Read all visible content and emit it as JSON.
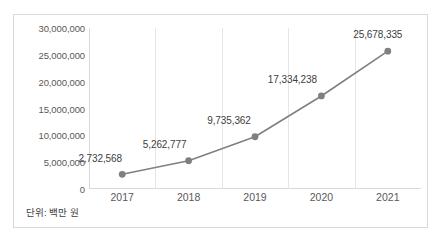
{
  "chart_data": {
    "type": "line",
    "title": "",
    "xlabel": "",
    "ylabel": "",
    "categories": [
      "2017",
      "2018",
      "2019",
      "2020",
      "2021"
    ],
    "values": [
      2732568,
      5262777,
      9735362,
      17334238,
      25678335
    ],
    "data_labels": [
      "2,732,568",
      "5,262,777",
      "9,735,362",
      "17,334,238",
      "25,678,335"
    ],
    "ylim": [
      0,
      30000000
    ],
    "ytick_values": [
      0,
      5000000,
      10000000,
      15000000,
      20000000,
      25000000,
      30000000
    ],
    "ytick_labels": [
      "0",
      "5,000,000",
      "10,000,000",
      "15,000,000",
      "20,000,000",
      "25,000,000",
      "30,000,000"
    ],
    "grid": "vertical-only",
    "legend": "none",
    "series_color": "#808080",
    "marker": "circle"
  },
  "caption": {
    "unit_note": "단위: 백만 원"
  },
  "footer": {
    "note": ""
  },
  "colors": {
    "series": "#808080",
    "gridline": "#e6e6e6",
    "axis": "#d9d9d9",
    "border": "#d9d9d9",
    "text": "#595959",
    "label_text": "#404040",
    "background": "#ffffff"
  }
}
